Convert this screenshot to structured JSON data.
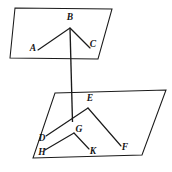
{
  "figure": {
    "canvas": {
      "width": 172,
      "height": 172
    },
    "stroke_color": "#1a1a1a",
    "background_color": "#ffffff",
    "planes": [
      {
        "name": "upper-plane",
        "points": "15,8 112,9 98,59 10,58"
      },
      {
        "name": "lower-plane",
        "points": "55,93 166,90 142,155 33,158"
      }
    ],
    "segments": [
      {
        "name": "segment-A-B",
        "x1": 38,
        "y1": 50,
        "x2": 70,
        "y2": 28
      },
      {
        "name": "segment-B-C",
        "x1": 70,
        "y1": 28,
        "x2": 90,
        "y2": 48
      },
      {
        "name": "segment-D-E",
        "x1": 46,
        "y1": 136,
        "x2": 88,
        "y2": 108
      },
      {
        "name": "segment-E-F",
        "x1": 88,
        "y1": 108,
        "x2": 121,
        "y2": 146
      },
      {
        "name": "segment-H-G",
        "x1": 45,
        "y1": 150,
        "x2": 74,
        "y2": 133
      },
      {
        "name": "segment-G-K",
        "x1": 74,
        "y1": 133,
        "x2": 89,
        "y2": 149
      }
    ],
    "vertical_segment": {
      "name": "segment-B-G-vertical",
      "x1": 70,
      "y1": 28,
      "x2": 72.5,
      "y2": 122
    },
    "labels": [
      {
        "name": "vertex-label-A",
        "text": "A",
        "x": 33,
        "y": 49
      },
      {
        "name": "vertex-label-B",
        "text": "B",
        "x": 70,
        "y": 18
      },
      {
        "name": "vertex-label-C",
        "text": "C",
        "x": 93,
        "y": 45
      },
      {
        "name": "vertex-label-D",
        "text": "D",
        "x": 42,
        "y": 139
      },
      {
        "name": "vertex-label-E",
        "text": "E",
        "x": 90,
        "y": 99
      },
      {
        "name": "vertex-label-F",
        "text": "F",
        "x": 125,
        "y": 148
      },
      {
        "name": "vertex-label-G",
        "text": "G",
        "x": 79,
        "y": 130
      },
      {
        "name": "vertex-label-H",
        "text": "H",
        "x": 42,
        "y": 153
      },
      {
        "name": "vertex-label-K",
        "text": "K",
        "x": 93,
        "y": 152
      }
    ]
  }
}
